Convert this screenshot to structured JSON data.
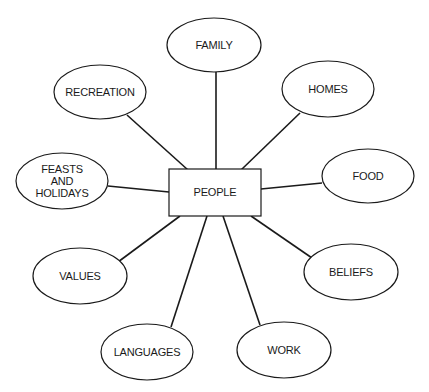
{
  "diagram": {
    "type": "concept-map",
    "center": {
      "label": "PEOPLE",
      "shape": "rectangle",
      "x": 169,
      "y": 169,
      "w": 92,
      "h": 47
    },
    "nodes": [
      {
        "id": "family",
        "lines": [
          "FAMILY"
        ],
        "cx": 214,
        "cy": 45,
        "rx": 47,
        "ry": 27,
        "edge": [
          216,
          72,
          216,
          170
        ]
      },
      {
        "id": "recreation",
        "lines": [
          "RECREATION"
        ],
        "cx": 100,
        "cy": 92,
        "rx": 46,
        "ry": 27,
        "edge": [
          127,
          115,
          188,
          170
        ]
      },
      {
        "id": "homes",
        "lines": [
          "HOMES"
        ],
        "cx": 328,
        "cy": 89,
        "rx": 46,
        "ry": 28,
        "edge": [
          300,
          113,
          241,
          170
        ]
      },
      {
        "id": "feasts-and-holidays",
        "lines": [
          "FEASTS",
          "AND",
          "HOLIDAYS"
        ],
        "cx": 62,
        "cy": 181,
        "rx": 46,
        "ry": 28,
        "edge": [
          108,
          186,
          169,
          192
        ]
      },
      {
        "id": "food",
        "lines": [
          "FOOD"
        ],
        "cx": 368,
        "cy": 176,
        "rx": 46,
        "ry": 27,
        "edge": [
          261,
          189,
          322,
          183
        ]
      },
      {
        "id": "values",
        "lines": [
          "VALUES"
        ],
        "cx": 80,
        "cy": 276,
        "rx": 47,
        "ry": 28,
        "edge": [
          180,
          216,
          118,
          262
        ]
      },
      {
        "id": "beliefs",
        "lines": [
          "BELIEFS"
        ],
        "cx": 351,
        "cy": 272,
        "rx": 47,
        "ry": 28,
        "edge": [
          251,
          216,
          312,
          258
        ]
      },
      {
        "id": "languages",
        "lines": [
          "LANGUAGES"
        ],
        "cx": 147,
        "cy": 352,
        "rx": 46,
        "ry": 28,
        "edge": [
          207,
          216,
          171,
          327
        ]
      },
      {
        "id": "work",
        "lines": [
          "WORK"
        ],
        "cx": 284,
        "cy": 350,
        "rx": 47,
        "ry": 28,
        "edge": [
          223,
          216,
          260,
          325
        ]
      }
    ]
  }
}
